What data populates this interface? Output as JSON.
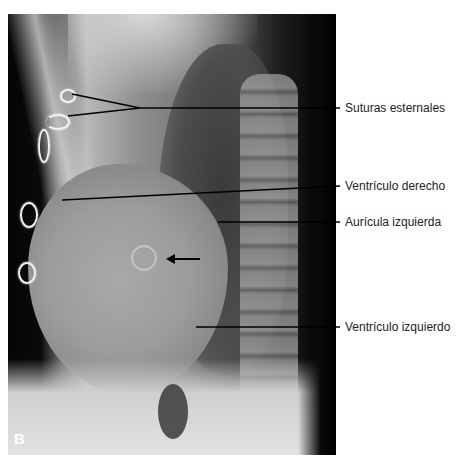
{
  "figure": {
    "panel_letter": "B",
    "image_description": "Lateral chest radiograph with sternal sutures and a valve ring",
    "labels": [
      {
        "text": "Suturas esternales",
        "y": 108
      },
      {
        "text": "Ventrículo derecho",
        "y": 186
      },
      {
        "text": "Aurícula izquierda",
        "y": 222
      },
      {
        "text": "Ventrículo izquierdo",
        "y": 327
      }
    ],
    "arrow": {
      "direction": "left",
      "points_to": "valve-ring"
    },
    "colors": {
      "background": "#ffffff",
      "label_text": "#222222",
      "leader_line": "#000000"
    }
  }
}
